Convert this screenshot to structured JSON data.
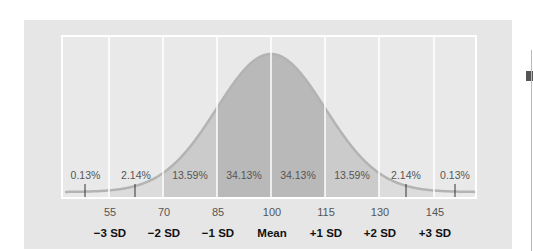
{
  "chart_data": {
    "type": "area",
    "title": "",
    "mean": 100,
    "sd": 15,
    "x_ticks": [
      55,
      70,
      85,
      100,
      115,
      130,
      145
    ],
    "sd_labels": [
      "−3 SD",
      "−2 SD",
      "−1 SD",
      "Mean",
      "+1 SD",
      "+2 SD",
      "+3 SD"
    ],
    "bands": [
      {
        "range": "< 55",
        "percent": "0.13%"
      },
      {
        "range": "55–70",
        "percent": "2.14%"
      },
      {
        "range": "70–85",
        "percent": "13.59%"
      },
      {
        "range": "85–100",
        "percent": "34.13%"
      },
      {
        "range": "100–115",
        "percent": "34.13%"
      },
      {
        "range": "115–130",
        "percent": "13.59%"
      },
      {
        "range": "130–145",
        "percent": "2.14%"
      },
      {
        "range": "> 145",
        "percent": "0.13%"
      }
    ],
    "grid": true,
    "legend": "none"
  },
  "colors": {
    "panel": "#e6e6e6",
    "frame": "#ffffff",
    "sd1_fill": "#b9b9b9",
    "sd2_fill": "#cbcbcb",
    "sd3_fill": "#dcdcdc",
    "curve": "#b3b3b3"
  }
}
